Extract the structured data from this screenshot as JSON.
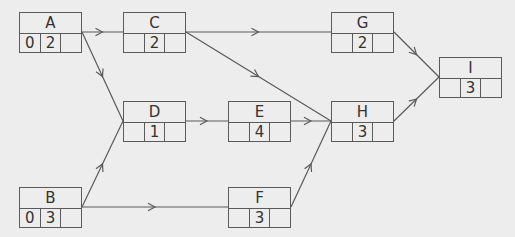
{
  "diagram": {
    "type": "activity-on-node network",
    "colors": {
      "background": "#ededed",
      "line": "#5a5a5a",
      "text": "#333333"
    },
    "nodes": [
      {
        "id": "A",
        "name": "A",
        "cells": [
          "0",
          "2",
          ""
        ],
        "x": 19,
        "y": 12
      },
      {
        "id": "B",
        "name": "B",
        "cells": [
          "0",
          "3",
          ""
        ],
        "x": 19,
        "y": 187
      },
      {
        "id": "C",
        "name": "C",
        "cells": [
          "",
          "2",
          ""
        ],
        "x": 123,
        "y": 12
      },
      {
        "id": "D",
        "name": "D",
        "cells": [
          "",
          "1",
          ""
        ],
        "x": 123,
        "y": 101
      },
      {
        "id": "E",
        "name": "E",
        "cells": [
          "",
          "4",
          ""
        ],
        "x": 228,
        "y": 101
      },
      {
        "id": "F",
        "name": "F",
        "cells": [
          "",
          "3",
          ""
        ],
        "x": 228,
        "y": 187
      },
      {
        "id": "G",
        "name": "G",
        "cells": [
          "",
          "2",
          ""
        ],
        "x": 331,
        "y": 12
      },
      {
        "id": "H",
        "name": "H",
        "cells": [
          "",
          "3",
          ""
        ],
        "x": 331,
        "y": 101
      },
      {
        "id": "I",
        "name": "I",
        "cells": [
          "",
          "3",
          ""
        ],
        "x": 439,
        "y": 57
      }
    ],
    "edges": [
      {
        "from": "A",
        "to": "C"
      },
      {
        "from": "A",
        "to": "D"
      },
      {
        "from": "C",
        "to": "G"
      },
      {
        "from": "C",
        "to": "H"
      },
      {
        "from": "B",
        "to": "D"
      },
      {
        "from": "B",
        "to": "F"
      },
      {
        "from": "D",
        "to": "E"
      },
      {
        "from": "E",
        "to": "H"
      },
      {
        "from": "F",
        "to": "H"
      },
      {
        "from": "G",
        "to": "I"
      },
      {
        "from": "H",
        "to": "I"
      }
    ]
  }
}
